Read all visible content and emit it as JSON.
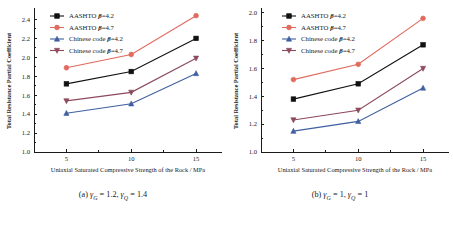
{
  "figure": {
    "panels": [
      {
        "id": "a",
        "caption_prefix": "(a)",
        "caption_gamma_g": "1.2",
        "caption_gamma_q": "1.4",
        "xlabel": "Uniaxial Saturated Compressive Strength of the Rock / MPa",
        "ylabel": "Total Resistance Partial Coefficient"
      },
      {
        "id": "b",
        "caption_prefix": "(b)",
        "caption_gamma_g": "1",
        "caption_gamma_q": "1",
        "xlabel": "Uniaxial Saturated Compressive Strength of the Rock / MPa",
        "ylabel": "Total Resistance Partial Coefficient"
      }
    ]
  },
  "symbols": {
    "gamma": "γ",
    "beta": "β",
    "sub_g": "G",
    "sub_q": "Q",
    "equals": "="
  },
  "legend": {
    "entries": [
      {
        "label_prefix": "AASHTO",
        "beta_value": "4.2",
        "marker": "square",
        "color": "#111111"
      },
      {
        "label_prefix": "AASHTO",
        "beta_value": "4.7",
        "marker": "circle",
        "color": "#e06a5e"
      },
      {
        "label_prefix": "Chinese code",
        "beta_value": "4.2",
        "marker": "triangle-up",
        "color": "#3f5fa0"
      },
      {
        "label_prefix": "Chinese code",
        "beta_value": "4.7",
        "marker": "triangle-down",
        "color": "#8c4a5c"
      }
    ]
  },
  "chart_data": [
    {
      "type": "line",
      "id": "a",
      "title": "(a) γG = 1.2, γQ = 1.4",
      "xlabel": "Uniaxial Saturated Compressive Strength of the Rock / MPa",
      "ylabel": "Total Resistance Partial Coefficient",
      "x": [
        5,
        10,
        15
      ],
      "xticks": [
        5,
        10,
        15
      ],
      "xlim": [
        2.5,
        17.0
      ],
      "yticks": [
        1.0,
        1.2,
        1.4,
        1.6,
        1.8,
        2.0,
        2.2,
        2.4
      ],
      "ylim": [
        1.0,
        2.5
      ],
      "grid": false,
      "legend_position": "top-left",
      "series": [
        {
          "name": "AASHTO β=4.2",
          "color": "#111111",
          "marker": "square",
          "values": [
            1.72,
            1.85,
            2.2
          ]
        },
        {
          "name": "AASHTO β=4.7",
          "color": "#e06a5e",
          "marker": "circle",
          "values": [
            1.89,
            2.03,
            2.44
          ]
        },
        {
          "name": "Chinese code β=4.2",
          "color": "#3f5fa0",
          "marker": "triangle-up",
          "values": [
            1.41,
            1.51,
            1.83
          ]
        },
        {
          "name": "Chinese code β=4.7",
          "color": "#8c4a5c",
          "marker": "triangle-down",
          "values": [
            1.54,
            1.63,
            1.99
          ]
        }
      ]
    },
    {
      "type": "line",
      "id": "b",
      "title": "(b) γG = 1, γQ = 1",
      "xlabel": "Uniaxial Saturated Compressive Strength of the Rock / MPa",
      "ylabel": "Total Resistance Partial Coefficient",
      "x": [
        5,
        10,
        15
      ],
      "xticks": [
        5,
        10,
        15
      ],
      "xlim": [
        2.5,
        17.0
      ],
      "yticks": [
        1.0,
        1.2,
        1.4,
        1.6,
        1.8,
        2.0
      ],
      "ylim": [
        1.0,
        2.02
      ],
      "grid": false,
      "legend_position": "top-left",
      "series": [
        {
          "name": "AASHTO β=4.2",
          "color": "#111111",
          "marker": "square",
          "values": [
            1.38,
            1.49,
            1.77
          ]
        },
        {
          "name": "AASHTO β=4.7",
          "color": "#e06a5e",
          "marker": "circle",
          "values": [
            1.52,
            1.63,
            1.96
          ]
        },
        {
          "name": "Chinese code β=4.2",
          "color": "#3f5fa0",
          "marker": "triangle-up",
          "values": [
            1.15,
            1.22,
            1.46
          ]
        },
        {
          "name": "Chinese code β=4.7",
          "color": "#8c4a5c",
          "marker": "triangle-down",
          "values": [
            1.23,
            1.3,
            1.6
          ]
        }
      ]
    }
  ]
}
